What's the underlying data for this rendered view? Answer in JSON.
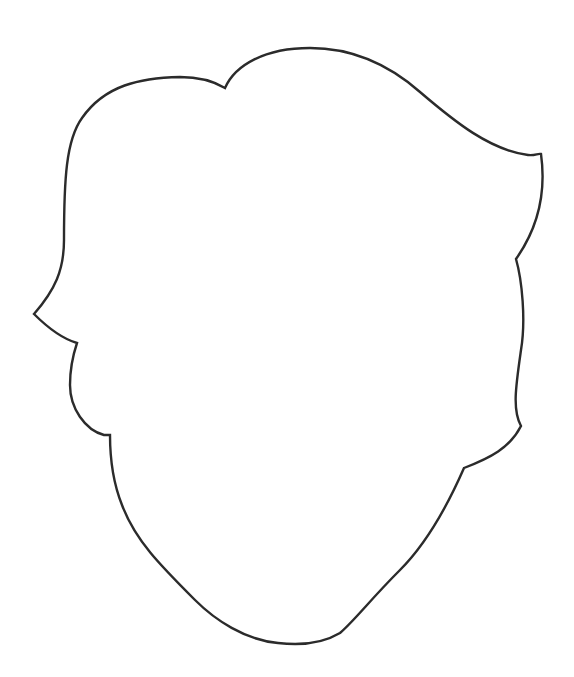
{
  "drawing": {
    "subject": "blank head outline with hair",
    "stroke_color": "#2b2b2b",
    "fill_color": "#ffffff",
    "background_color": "#ffffff"
  }
}
